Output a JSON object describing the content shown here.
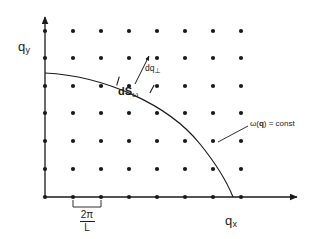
{
  "figure": {
    "background": "#ffffff",
    "ink": "#1a1a1a",
    "width": 317,
    "height": 239
  },
  "axes": {
    "origin": {
      "x": 45,
      "y": 197
    },
    "x_axis": {
      "label": "q",
      "subscript": "x",
      "from_x": 45,
      "to_x": 300,
      "y": 197,
      "arrow": true
    },
    "y_axis": {
      "label": "q",
      "subscript": "y",
      "from_y": 197,
      "to_y": 14,
      "x": 45,
      "arrow": true
    }
  },
  "lattice": {
    "spacing_px": 28,
    "spacing_label_numerator": "2π",
    "spacing_label_denominator": "L",
    "dot_radius": 2.1,
    "columns_x": [
      45,
      73,
      101,
      129,
      157,
      185,
      213,
      241
    ],
    "rows_y": [
      197,
      169,
      141,
      113,
      86,
      58,
      31
    ],
    "count": 56
  },
  "curve": {
    "name": "constant-frequency-contour",
    "label": "ω(q) = const",
    "label_omega": "ω(",
    "label_q": "q",
    "label_tail": ") = const",
    "start": {
      "x": 45,
      "y": 73
    },
    "end": {
      "x": 233,
      "y": 197
    },
    "path": "M 45 73 C 104 76, 168 104, 200 144 C 217 165, 227 182, 233 197"
  },
  "segment": {
    "name": "surface-element",
    "label": "dS",
    "label_subscript": "ω",
    "tick1": {
      "x": 118,
      "y": 81
    },
    "tick2": {
      "x": 152,
      "y": 89
    }
  },
  "normal_arrow": {
    "name": "perpendicular-wavevector-increment",
    "label": "dq",
    "label_subscript": "⊥",
    "from": {
      "x": 135,
      "y": 84
    },
    "to": {
      "x": 149,
      "y": 56
    }
  },
  "leader": {
    "name": "contour-leader-line",
    "from": {
      "x": 218,
      "y": 142
    },
    "to": {
      "x": 248,
      "y": 126
    }
  },
  "spacing_bracket": {
    "left_x": 73,
    "right_x": 101,
    "top_y": 200,
    "bottom_y": 207
  }
}
